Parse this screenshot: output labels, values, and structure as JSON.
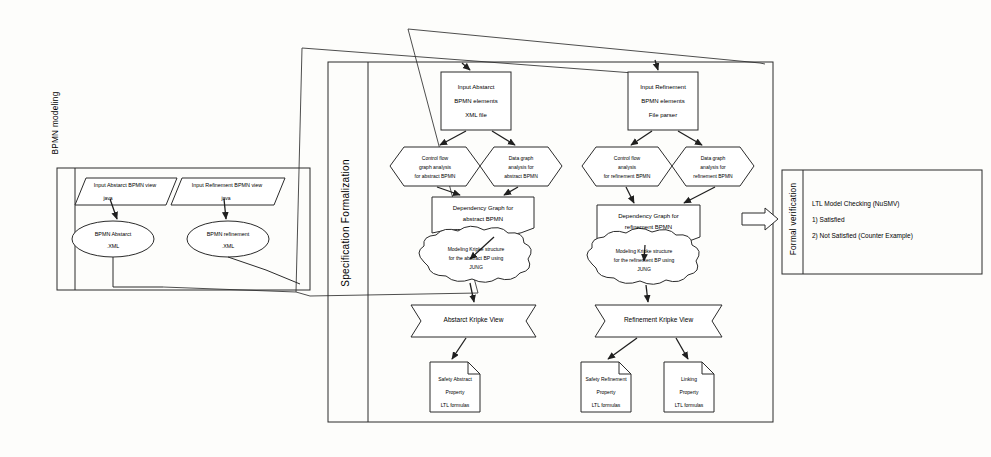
{
  "figure": {
    "kind": "scanned-flowchart",
    "ink_color": "#2b2b2b",
    "paper_color": "#fdfdfb"
  },
  "panels": {
    "bpmn_modeling": {
      "label": "BPMN modeling"
    },
    "specification_formalization": {
      "label": "Specification Formalization"
    },
    "formal_verification": {
      "label": "Formal verification"
    }
  },
  "bpmn_modeling": {
    "inputs": [
      {
        "name": "input-abstract-bpmn-view",
        "label": "Input Abstarct BPMN view",
        "connector_label": "java"
      },
      {
        "name": "input-refinement-bpmn-view",
        "label": "Input Refinement BPMN view",
        "connector_label": "java"
      }
    ],
    "artifacts": [
      {
        "name": "bpmn-abstract-xml",
        "line1": "BPMN Abstarct",
        "line2": ".XML"
      },
      {
        "name": "bpmn-refinement-xml",
        "line1": "BPMN refinement",
        "line2": ".XML"
      }
    ]
  },
  "abstract_column": {
    "input_box": {
      "line1": "Input Abstarct",
      "line2": "BPMN elements",
      "line3": "XML file"
    },
    "analyses": [
      {
        "name": "control-flow-graph-analysis-abstract",
        "line1": "Control flow",
        "line2": "graph analysis",
        "line3": "for abstract BPMN"
      },
      {
        "name": "data-graph-analysis-abstract",
        "line1": "Data graph",
        "line2": "analysis for",
        "line3": "abstract BPMN"
      }
    ],
    "dependency_graph": {
      "line1": "Dependency Graph for",
      "line2": "abstract BPMN"
    },
    "kripke_modeling": {
      "line1": "Modeling Kripke structure",
      "line2": "for the abstract BP using",
      "line3": "JUNG"
    },
    "kripke_view": {
      "label": "Abstarct Kripke View"
    },
    "properties": [
      {
        "name": "safety-abstract-property",
        "line1": "Safety Abstract",
        "line2": "Property",
        "line3": "LTL formulas"
      }
    ]
  },
  "refinement_column": {
    "input_box": {
      "line1": "Input Refinement",
      "line2": "BPMN elements",
      "line3": "File parser"
    },
    "analyses": [
      {
        "name": "control-flow-analysis-refinement",
        "line1": "Control flow",
        "line2": "analysis",
        "line3": "for refinement BPMN"
      },
      {
        "name": "data-graph-analysis-refinement",
        "line1": "Data graph",
        "line2": "analysis for",
        "line3": "refinement BPMN"
      }
    ],
    "dependency_graph": {
      "line1": "Dependency Graph for",
      "line2": "refinement BPMN"
    },
    "kripke_modeling": {
      "line1": "Modeling Kripke structure",
      "line2": "for the refinement BP using",
      "line3": "JUNG"
    },
    "kripke_view": {
      "label": "Refinement Kripke View"
    },
    "properties": [
      {
        "name": "safety-refinement-property",
        "line1": "Safety Refinement",
        "line2": "Property",
        "line3": "LTL formulas"
      },
      {
        "name": "linking-property",
        "line1": "Linking",
        "line2": "Property",
        "line3": "LTL formulas"
      }
    ]
  },
  "formal_verification": {
    "title": "LTL Model Checking (NuSMV)",
    "results": [
      "1) Satisfied",
      "2) Not Satisfied (Counter Example)"
    ]
  }
}
